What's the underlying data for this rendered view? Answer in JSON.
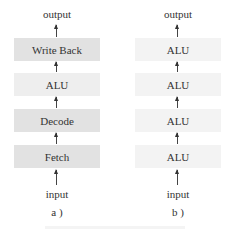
{
  "diagram": {
    "a": {
      "output_label": "output",
      "stages_top_to_bottom": [
        "Write Back",
        "ALU",
        "Decode",
        "Fetch"
      ],
      "input_label": "input",
      "caption": "a )"
    },
    "b": {
      "output_label": "output",
      "stages_top_to_bottom": [
        "ALU",
        "ALU",
        "ALU",
        "ALU"
      ],
      "input_label": "input",
      "caption": "b )"
    },
    "colors": {
      "stage_fill_a": "#e2e2e2",
      "stage_fill_a_alu": "#eeeeee",
      "stage_fill_b": "#f3f3f3",
      "text": "#333333",
      "arrow": "#444444"
    }
  }
}
